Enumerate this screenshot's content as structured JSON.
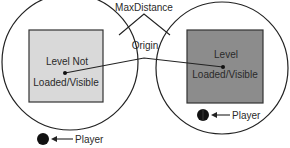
{
  "diagram": {
    "labels": {
      "max_distance": "MaxDistance",
      "origin": "Origin"
    },
    "left_zone": {
      "level_line1": "Level Not",
      "level_line2": "Loaded/Visible",
      "player_label": "Player",
      "level_fill": "#d9d9d9"
    },
    "right_zone": {
      "level_line1": "Level",
      "level_line2": "Loaded/Visible",
      "player_label": "Player",
      "level_fill": "#8c8c8c"
    }
  }
}
